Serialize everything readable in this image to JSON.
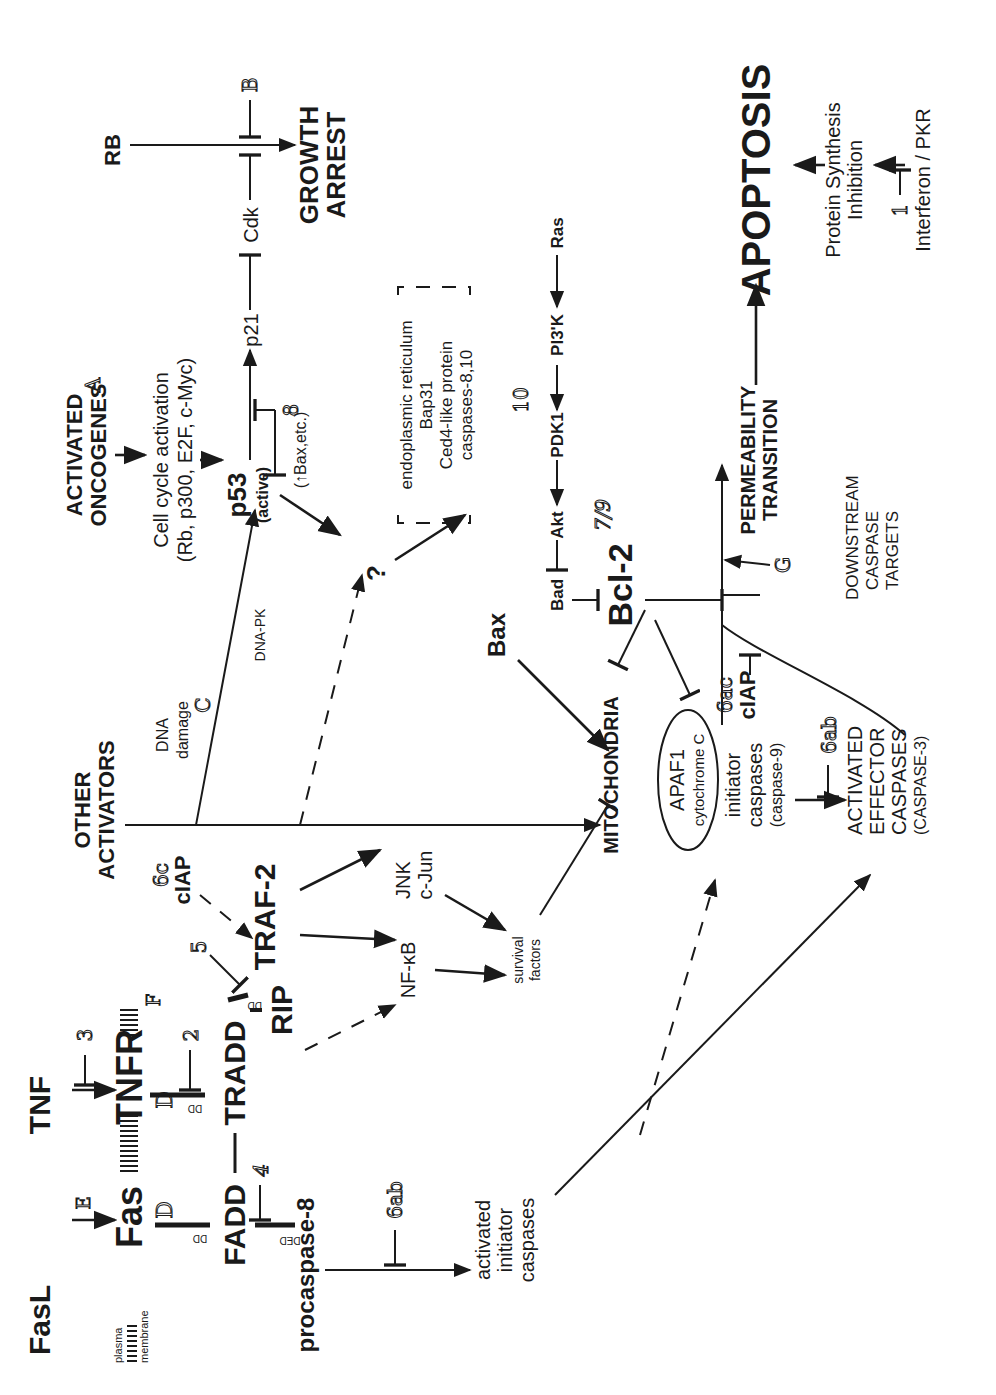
{
  "diagram": {
    "orientation": "rotated -90deg (landscape content in portrait frame)",
    "membrane": {
      "plasma": "plasma",
      "membrane": "membrane"
    },
    "ligands": {
      "fasl": "FasL",
      "tnf": "TNF"
    },
    "receptors": {
      "fas": "Fas",
      "tnfr": "TNFR"
    },
    "adapters": {
      "fadd": "FADD",
      "tradd": "TRADD",
      "rip": "RIP",
      "traf2": "TRAF-2",
      "procaspase8": "procaspase-8"
    },
    "domains": {
      "dd1": "DD",
      "dd2": "DD",
      "dd3": "DD",
      "ded": "DED"
    },
    "ciap_top": {
      "tag": "6c",
      "label": "cIAP"
    },
    "ciap_mid": {
      "tag": "6ac",
      "label": "cIAP"
    },
    "signaling": {
      "nfkb": "NF-κB",
      "jnk": "JNK",
      "cjun": "c-Jun",
      "survival1": "survival",
      "survival2": "factors"
    },
    "initiator_left": {
      "l1": "activated",
      "l2": "initiator",
      "l3": "caspases"
    },
    "other_activators": {
      "l1": "OTHER",
      "l2": "ACTIVATORS"
    },
    "dna_damage": {
      "l1": "DNA",
      "l2": "damage",
      "dnapk": "DNA-PK"
    },
    "oncogenes": {
      "l1": "ACTIVATED",
      "l2": "ONCOGENES"
    },
    "cell_cycle": {
      "l1": "Cell cycle activation",
      "l2": "(Rb, p300, E2F, c-Myc)"
    },
    "p53": {
      "label": "p53",
      "sub": "(active)",
      "bax_note": "(↑Bax,etc.)"
    },
    "p21": "p21",
    "cdk": "Cdk",
    "rb": "RB",
    "growth_arrest": {
      "l1": "GROWTH",
      "l2": "ARREST"
    },
    "unknown": "?",
    "er_box": {
      "l1": "endoplasmic reticulum",
      "l2": "Bap31",
      "l3": "Ced4-like protein",
      "l4": "caspases-8,10"
    },
    "bax": "Bax",
    "pathway_row": {
      "bad": "Bad",
      "akt": "Akt",
      "pdk1": "PDK1",
      "pi3k": "PI3'K",
      "ras": "Ras"
    },
    "bcl2": {
      "label": "Bcl-2",
      "tag": "7/9"
    },
    "mitochondria": "MITOCHONDRIA",
    "apaf": {
      "l1": "APAF1",
      "l2": "cytochrome C"
    },
    "initiator_mid": {
      "l1": "initiator",
      "l2": "caspases",
      "l3": "(caspase-9)"
    },
    "effector": {
      "l1": "ACTIVATED",
      "l2": "EFFECTOR",
      "l3": "CASPASES",
      "l4": "(CASPASE-3)"
    },
    "downstream": {
      "l1": "DOWNSTREAM",
      "l2": "CASPASE",
      "l3": "TARGETS"
    },
    "permeability": {
      "l1": "PERMEABILITY",
      "l2": "TRANSITION"
    },
    "apoptosis": "APOPTOSIS",
    "protein_synth": {
      "l1": "Protein Synthesis",
      "l2": "Inhibition"
    },
    "interferon": "Interferon / PKR",
    "tags": {
      "A": "A",
      "B": "B",
      "C": "C",
      "D1": "D",
      "D2": "D",
      "E": "E",
      "F": "F",
      "G": "G",
      "n1": "1",
      "n2": "2",
      "n3": "3",
      "n4": "4",
      "n5": "5",
      "n8": "8",
      "n10": "10",
      "n6ab_left": "6ab",
      "n6ab_mid": "6ab"
    }
  }
}
